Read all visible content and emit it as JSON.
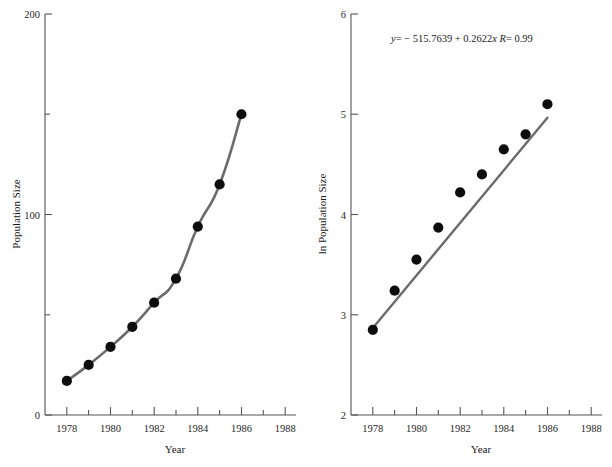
{
  "figure": {
    "panels": [
      "left-linear-plot",
      "right-log-plot"
    ]
  },
  "chart_data": [
    {
      "type": "line",
      "id": "population-linear",
      "title": "",
      "xlabel": "Year",
      "ylabel": "Population Size",
      "xlim": [
        1977,
        1988.5
      ],
      "ylim": [
        0,
        200
      ],
      "xticks": [
        1978,
        1980,
        1982,
        1984,
        1986,
        1988
      ],
      "xtick_labels": [
        "1978",
        "1980",
        "1982",
        "1984",
        "1986",
        "1988"
      ],
      "xminor_ticks": [
        1979,
        1981,
        1983,
        1985,
        1987
      ],
      "yticks": [
        0,
        100,
        200
      ],
      "ytick_labels": [
        "0",
        "100",
        "200"
      ],
      "yminor_ticks": [
        50,
        150
      ],
      "grid": false,
      "legend": null,
      "x": [
        1978,
        1979,
        1980,
        1981,
        1982,
        1983,
        1984,
        1985,
        1986
      ],
      "values": [
        17,
        25,
        34,
        44,
        56,
        68,
        94,
        115,
        150
      ],
      "marker": "filled-circle",
      "line_color": "#6b6b6b",
      "marker_color": "#0d0d0d"
    },
    {
      "type": "scatter",
      "id": "population-log",
      "title": "",
      "xlabel": "Year",
      "ylabel": "ln Population Size",
      "xlim": [
        1977,
        1988.5
      ],
      "ylim": [
        2,
        6
      ],
      "xticks": [
        1978,
        1980,
        1982,
        1984,
        1986,
        1988
      ],
      "xtick_labels": [
        "1978",
        "1980",
        "1982",
        "1984",
        "1986",
        "1988"
      ],
      "xminor_ticks": [
        1979,
        1981,
        1983,
        1985,
        1987
      ],
      "yticks": [
        2,
        3,
        4,
        5,
        6
      ],
      "ytick_labels": [
        "2",
        "3",
        "4",
        "5",
        "6"
      ],
      "yminor_ticks": [],
      "grid": false,
      "legend": null,
      "x": [
        1978,
        1979,
        1980,
        1981,
        1982,
        1983,
        1984,
        1985,
        1986
      ],
      "values": [
        2.85,
        3.24,
        3.55,
        3.87,
        4.22,
        4.4,
        4.65,
        4.8,
        5.1
      ],
      "marker": "filled-circle",
      "marker_color": "#0d0d0d",
      "fit": {
        "type": "linear-regression",
        "intercept": -515.7639,
        "slope": 0.2622,
        "r": 0.99,
        "x_start": 1978,
        "x_end": 1986,
        "color": "#6b6b6b",
        "annotation": "y = − 515.7639 + 0.2622x   R = 0.99",
        "annotation_parts": {
          "y_symbol": "y",
          "equals": "= − 515.7639 + 0.2622",
          "x_symbol": "x",
          "r_symbol": "R",
          "r_value": "= 0.99"
        }
      }
    }
  ]
}
